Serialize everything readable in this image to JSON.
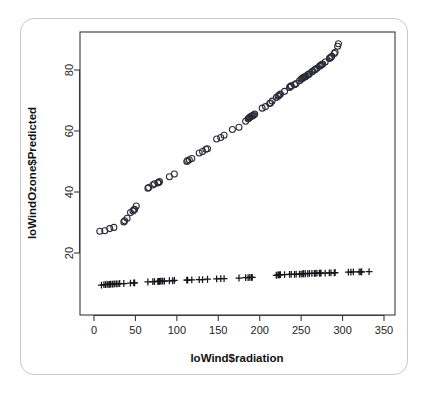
{
  "figure": {
    "background_color": "#ffffff",
    "frame_color": "#c9c9c9",
    "point_color": "#2b2b38",
    "axis_color": "#3a3a3a"
  },
  "chart_data": {
    "type": "scatter",
    "title": "",
    "xlabel": "loWind$radiation",
    "ylabel": "loWindOzone$Predicted",
    "xlim": [
      0,
      350
    ],
    "ylim": [
      8,
      92
    ],
    "grid": false,
    "legend": "none",
    "xticks": [
      0,
      50,
      100,
      150,
      200,
      250,
      300,
      350
    ],
    "xtick_labels": [
      "0",
      "50",
      "100",
      "150",
      "200",
      "250",
      "300",
      "350"
    ],
    "yticks": [
      20,
      40,
      60,
      80
    ],
    "ytick_labels": [
      "20",
      "40",
      "60",
      "80"
    ],
    "series": [
      {
        "name": "Predicted",
        "marker": "circle",
        "x": [
          7,
          13,
          19,
          24,
          36,
          37,
          40,
          44,
          47,
          48,
          49,
          51,
          65,
          66,
          71,
          73,
          77,
          78,
          79,
          91,
          97,
          112,
          113,
          115,
          118,
          127,
          131,
          135,
          137,
          148,
          153,
          157,
          167,
          175,
          183,
          186,
          187,
          188,
          189,
          190,
          191,
          192,
          193,
          194,
          203,
          207,
          212,
          213,
          215,
          220,
          222,
          223,
          224,
          225,
          230,
          236,
          237,
          238,
          242,
          244,
          248,
          250,
          251,
          252,
          253,
          254,
          255,
          256,
          258,
          259,
          260,
          263,
          264,
          266,
          267,
          269,
          272,
          273,
          274,
          275,
          276,
          279,
          284,
          285,
          286,
          287,
          290,
          291,
          294,
          295
        ],
        "y": [
          27.1,
          27.3,
          28.0,
          28.4,
          30.2,
          30.6,
          31.4,
          33.3,
          33.8,
          34.2,
          34.3,
          35.4,
          41.2,
          41.5,
          42.3,
          42.7,
          43.0,
          43.1,
          43.4,
          45.0,
          45.9,
          50.0,
          50.3,
          50.6,
          51.0,
          52.8,
          53.3,
          54.0,
          54.2,
          57.4,
          57.9,
          58.6,
          60.5,
          61.2,
          63.2,
          64.0,
          64.2,
          64.5,
          64.7,
          64.8,
          65.0,
          65.1,
          65.3,
          65.6,
          67.5,
          68.0,
          69.0,
          69.2,
          69.8,
          71.0,
          71.4,
          71.6,
          71.9,
          72.1,
          73.0,
          74.3,
          74.6,
          74.8,
          75.2,
          75.6,
          76.5,
          77.0,
          77.2,
          77.4,
          77.6,
          77.7,
          77.8,
          78.0,
          78.4,
          78.6,
          78.8,
          79.4,
          79.6,
          80.0,
          80.2,
          80.6,
          81.2,
          81.4,
          81.6,
          81.8,
          82.0,
          82.6,
          83.8,
          84.0,
          84.2,
          84.5,
          85.4,
          85.8,
          87.8,
          88.6
        ]
      },
      {
        "name": "Observed",
        "marker": "plus",
        "x": [
          9,
          12,
          14,
          16,
          18,
          19,
          20,
          22,
          23,
          25,
          27,
          29,
          31,
          36,
          44,
          48,
          49,
          65,
          71,
          73,
          77,
          78,
          79,
          80,
          82,
          83,
          85,
          91,
          95,
          97,
          112,
          113,
          118,
          127,
          131,
          137,
          148,
          153,
          157,
          175,
          183,
          186,
          188,
          190,
          191,
          220,
          222,
          223,
          224,
          225,
          230,
          236,
          238,
          242,
          244,
          248,
          250,
          252,
          253,
          255,
          258,
          260,
          263,
          266,
          267,
          269,
          272,
          273,
          274,
          279,
          284,
          286,
          290,
          291,
          307,
          310,
          313,
          320,
          322,
          323,
          332
        ],
        "y": [
          9.5,
          9.6,
          9.6,
          9.7,
          9.7,
          9.7,
          9.8,
          9.8,
          9.8,
          9.9,
          9.9,
          9.9,
          10.0,
          10.0,
          10.1,
          10.2,
          10.2,
          10.5,
          10.6,
          10.6,
          10.7,
          10.7,
          10.7,
          10.8,
          10.8,
          10.8,
          10.8,
          10.9,
          10.9,
          11.0,
          11.1,
          11.1,
          11.2,
          11.3,
          11.3,
          11.4,
          11.5,
          11.6,
          11.6,
          11.8,
          11.9,
          11.9,
          12.0,
          12.0,
          12.0,
          12.7,
          12.8,
          12.8,
          12.8,
          12.9,
          12.9,
          13.0,
          13.0,
          13.0,
          13.1,
          13.1,
          13.1,
          13.2,
          13.2,
          13.2,
          13.2,
          13.3,
          13.3,
          13.3,
          13.3,
          13.4,
          13.4,
          13.4,
          13.4,
          13.4,
          13.5,
          13.5,
          13.5,
          13.6,
          13.7,
          13.7,
          13.8,
          13.8,
          13.8,
          13.8,
          13.9
        ]
      }
    ]
  }
}
